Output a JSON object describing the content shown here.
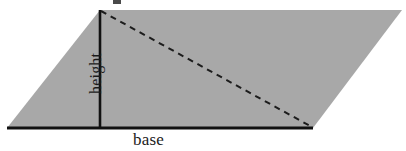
{
  "figure": {
    "kind": "geometry-diagram",
    "background_color": "#ffffff",
    "labels": {
      "base": "base",
      "height": "height"
    },
    "colors": {
      "fill": "#a8a8a8",
      "outline": "#111111",
      "dashed_line": "#1c1c1c",
      "text": "#1b1b1b"
    },
    "shape": {
      "type": "parallelogram",
      "vertices": [
        {
          "name": "top-left",
          "x": 100,
          "y": 10
        },
        {
          "name": "top-right",
          "x": 402,
          "y": 10
        },
        {
          "name": "bottom-right",
          "x": 313,
          "y": 128
        },
        {
          "name": "bottom-left",
          "x": 7,
          "y": 128
        }
      ]
    },
    "height_segment": {
      "style": "solid",
      "x1": 100,
      "y1": 10,
      "x2": 100,
      "y2": 128,
      "stroke_width": 2.6
    },
    "base_segment": {
      "style": "solid",
      "x1": 7,
      "y1": 128,
      "x2": 313,
      "y2": 128,
      "stroke_width": 3.2
    },
    "diagonal_segment": {
      "style": "dashed",
      "x1": 101,
      "y1": 11,
      "x2": 312,
      "y2": 127,
      "stroke_width": 2,
      "dash_pattern": "6 5"
    },
    "top_artifact": {
      "description": "small clipped dark mark at top edge",
      "x": 113,
      "y": 0,
      "width": 8,
      "height": 4,
      "color": "#4a4a4a"
    }
  }
}
